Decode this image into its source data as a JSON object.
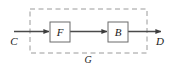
{
  "diagram": {
    "type": "block-diagram",
    "title": "",
    "canvas": {
      "width": 174,
      "height": 69,
      "background": "#ffffff"
    },
    "style": {
      "line_color": "#4a4a4a",
      "box_stroke": "#6b6b6b",
      "box_fill": "#ffffff",
      "dashed_color": "#9a9a9a",
      "text_color": "#1a1a1a"
    },
    "input": {
      "label": "C",
      "name": "input-signal-c"
    },
    "output": {
      "label": "D",
      "name": "output-signal-d"
    },
    "group": {
      "label": "G",
      "name": "group-g",
      "style": "dashed",
      "x": 30,
      "y": 9,
      "width": 117,
      "height": 44
    },
    "blocks": [
      {
        "id": "F",
        "label": "F",
        "name": "block-f",
        "x": 50,
        "y": 22,
        "width": 20,
        "height": 20
      },
      {
        "id": "B",
        "label": "B",
        "name": "block-b",
        "x": 108,
        "y": 22,
        "width": 20,
        "height": 20
      }
    ],
    "edges": [
      {
        "from": "C",
        "to": "F",
        "arrow": true
      },
      {
        "from": "F",
        "to": "B",
        "arrow": true
      },
      {
        "from": "B",
        "to": "D",
        "arrow": true
      }
    ]
  }
}
